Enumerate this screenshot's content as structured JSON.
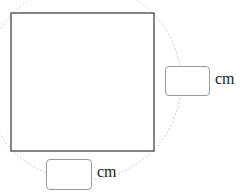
{
  "diagram": {
    "shape": "square",
    "colors": {
      "square_stroke": "#333333",
      "arc_stroke": "#cccccc",
      "box_border": "#9a9a9a"
    },
    "right_input": {
      "value": "",
      "unit": "cm"
    },
    "bottom_input": {
      "value": "",
      "unit": "cm"
    }
  }
}
